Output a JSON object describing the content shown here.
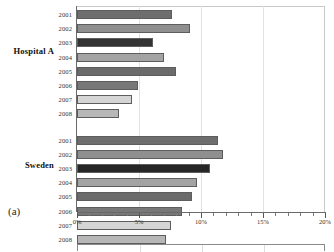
{
  "figure": {
    "panel_caption": "(a)",
    "group_labels": [
      "Hospital A",
      "Sweden"
    ]
  },
  "chart_data": {
    "type": "bar",
    "orientation": "horizontal",
    "title": "",
    "xlabel": "",
    "ylabel": "",
    "xlim": [
      0,
      20
    ],
    "x_unit": "%",
    "xticks": [
      0,
      5,
      10,
      15,
      20
    ],
    "xtick_labels": [
      "0%",
      "5%",
      "10%",
      "15%",
      "20%"
    ],
    "grid": true,
    "grid_axis": "x",
    "legend": "none",
    "groups": [
      {
        "name": "Hospital A",
        "categories": [
          "2001",
          "2002",
          "2003",
          "2004",
          "2005",
          "2006",
          "2007",
          "2008"
        ],
        "values": [
          7.7,
          9.1,
          6.1,
          7.0,
          8.0,
          4.9,
          4.4,
          3.4
        ],
        "colors": [
          "#6e6e6e",
          "#8f8f8f",
          "#333333",
          "#a3a3a3",
          "#6b6b6b",
          "#787878",
          "#d5d5d5",
          "#b7b7b7"
        ]
      },
      {
        "name": "Sweden",
        "categories": [
          "2001",
          "2002",
          "2003",
          "2004",
          "2005",
          "2006",
          "2007",
          "2008"
        ],
        "values": [
          11.4,
          11.8,
          10.7,
          9.7,
          9.3,
          8.5,
          7.6,
          7.2
        ],
        "colors": [
          "#6e6e6e",
          "#8f8f8f",
          "#262626",
          "#a3a3a3",
          "#6b6b6b",
          "#787878",
          "#d5d5d5",
          "#b7b7b7"
        ]
      }
    ]
  },
  "colors": {
    "axis": "#6a6a6a",
    "grid": "#e2e2e2",
    "text": "#2f2f2f",
    "background": "#ffffff"
  }
}
